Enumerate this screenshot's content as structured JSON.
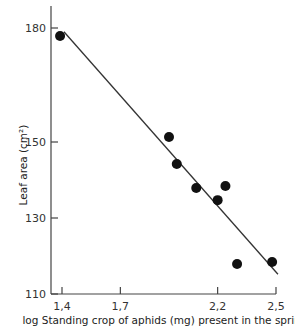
{
  "chart_data": {
    "type": "scatter",
    "title": "",
    "xlabel": "log Standing crop of aphids (mg) present in the spring",
    "ylabel": "Leaf area (cm²)",
    "xlim": [
      1.385,
      2.5
    ],
    "ylim": [
      110,
      184
    ],
    "x_ticks": [
      1.4,
      1.7,
      2.2,
      2.5
    ],
    "x_tick_labels": [
      "1.4",
      "1.7",
      "2.2",
      "2.5"
    ],
    "y_ticks": [
      110,
      130,
      150,
      180
    ],
    "y_tick_labels": [
      "110",
      "130",
      "150",
      "180"
    ],
    "grid": false,
    "legend": null,
    "series": [
      {
        "name": "observations",
        "kind": "points",
        "x": [
          1.39,
          1.95,
          1.99,
          2.09,
          2.24,
          2.2,
          2.3,
          2.48
        ],
        "y": [
          177.9,
          151.3,
          144.2,
          137.9,
          138.4,
          134.7,
          117.9,
          118.4
        ]
      },
      {
        "name": "regression line",
        "kind": "line",
        "x": [
          1.41,
          2.51
        ],
        "y": [
          179.0,
          115.2
        ]
      }
    ]
  },
  "labels": {
    "xlabel": "log Standing crop of aphids (mg) present in the spring",
    "ylabel": "Leaf area (cm²)"
  }
}
